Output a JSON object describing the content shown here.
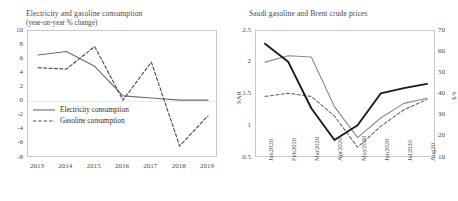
{
  "charts": {
    "left": {
      "title": "Electricity and gasoline consumption",
      "subtitle": "(year-on-year % change)",
      "legend": [
        {
          "label": "Electricity consumption",
          "style": "solid",
          "color": "#6b6b6b"
        },
        {
          "label": "Gasoline consumption",
          "style": "dashed",
          "color": "#4a4a4a"
        }
      ]
    },
    "right": {
      "title": "Saudi gasoline and Brent crude prices",
      "ylabel_left": "SAR",
      "ylabel_right": "$/b",
      "legend": [
        {
          "label": "Octane 95 (left axis)",
          "style": "solid",
          "color": "#8a8a8a"
        },
        {
          "label": "Octane 91 (left axis)",
          "style": "dashed",
          "color": "#6b6b6b"
        },
        {
          "label": "Brent crude (right axis)",
          "style": "solid-bold",
          "color": "#1a1a1a"
        }
      ]
    }
  },
  "chart_data": [
    {
      "type": "line",
      "title": "Electricity and gasoline consumption",
      "subtitle": "(year-on-year % change)",
      "xlabel": "",
      "ylabel": "",
      "ylim": [
        -8,
        10
      ],
      "yticks": [
        10,
        8,
        6,
        4,
        2,
        0,
        -2,
        -4,
        -6,
        -8
      ],
      "categories": [
        "2013",
        "2014",
        "2015",
        "2016",
        "2017",
        "2018",
        "2019"
      ],
      "grid": false,
      "legend_position": "inside-lower-left",
      "series": [
        {
          "name": "Electricity consumption",
          "style": "solid",
          "color": "#6b6b6b",
          "values": [
            6.6,
            7.1,
            5.0,
            0.8,
            0.5,
            0.2,
            0.2
          ]
        },
        {
          "name": "Gasoline consumption",
          "style": "dashed",
          "color": "#4a4a4a",
          "values": [
            4.8,
            4.6,
            7.8,
            0.2,
            5.6,
            -6.3,
            -2.0
          ]
        }
      ]
    },
    {
      "type": "line",
      "title": "Saudi gasoline and Brent crude prices",
      "xlabel": "",
      "ylabel": "SAR",
      "ylabel_right": "$/b",
      "ylim": [
        0.5,
        2.5
      ],
      "yticks": [
        2.5,
        2,
        1.5,
        1,
        0.5
      ],
      "ylim_right": [
        10,
        70
      ],
      "yticks_right": [
        70,
        60,
        50,
        40,
        30,
        20,
        10
      ],
      "categories": [
        "Jan2020",
        "Feb2020",
        "Mar2020",
        "Apr2020",
        "May2020",
        "Jun2020",
        "Jul2020",
        "Aug20"
      ],
      "grid": false,
      "legend_position": "inside-top-right",
      "series": [
        {
          "name": "Octane 95 (left axis)",
          "style": "solid",
          "color": "#8a8a8a",
          "axis": "left",
          "values": [
            2.01,
            2.11,
            2.09,
            1.31,
            0.82,
            1.13,
            1.36,
            1.44
          ]
        },
        {
          "name": "Octane 91 (left axis)",
          "style": "dashed",
          "color": "#6b6b6b",
          "axis": "left",
          "values": [
            1.47,
            1.52,
            1.47,
            1.16,
            0.67,
            1.0,
            1.26,
            1.42
          ]
        },
        {
          "name": "Brent crude (right axis)",
          "style": "solid-bold",
          "color": "#1a1a1a",
          "axis": "right",
          "values": [
            64.0,
            55.5,
            33.5,
            18.5,
            25.5,
            40.5,
            43.0,
            45.0
          ]
        }
      ]
    }
  ]
}
